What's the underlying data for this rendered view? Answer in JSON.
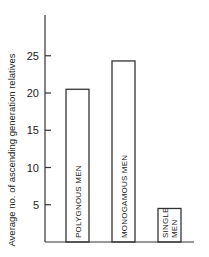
{
  "chart_data": {
    "type": "bar",
    "title": "",
    "xlabel": "",
    "ylabel": "Average no. of ascending generation relatives",
    "categories": [
      "POLYGNOUS MEN",
      "MONOGAMOUS MEN",
      "SINGLE MEN"
    ],
    "category_label_lines": [
      [
        "POLYGNOUS MEN"
      ],
      [
        "MONOGAMOUS MEN"
      ],
      [
        "SINGLE",
        "MEN"
      ]
    ],
    "values": [
      20.5,
      24.3,
      4.5
    ],
    "ylim": [
      0,
      30
    ],
    "yticks": [
      5,
      10,
      15,
      20,
      25
    ],
    "grid": false,
    "legend": "none"
  }
}
